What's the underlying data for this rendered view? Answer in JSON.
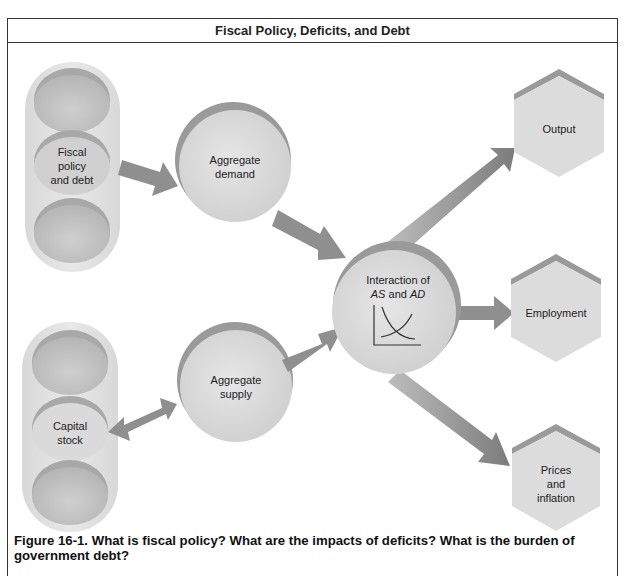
{
  "title": "Fiscal Policy, Deficits, and Debt",
  "nodes": {
    "fiscal": "Fiscal\npolicy\nand debt",
    "fiscal_lines": [
      "Fiscal",
      "policy",
      "and debt"
    ],
    "capital_lines": [
      "Capital",
      "stock"
    ],
    "agg_demand_lines": [
      "Aggregate",
      "demand"
    ],
    "agg_supply_lines": [
      "Aggregate",
      "supply"
    ],
    "interaction_line1": "Interaction of",
    "interaction_as": "AS",
    "interaction_and": " and ",
    "interaction_ad": "AD",
    "output": "Output",
    "employment": "Employment",
    "prices_lines": [
      "Prices",
      "and",
      "inflation"
    ]
  },
  "caption": "Figure 16-1. What is fiscal policy? What are the impacts of deficits? What is the burden of government debt?",
  "colors": {
    "arrow": "#8c8c8c",
    "node_fill": "#d9d9d9",
    "node_rim": "#9a9a9a",
    "frame": "#333333"
  }
}
